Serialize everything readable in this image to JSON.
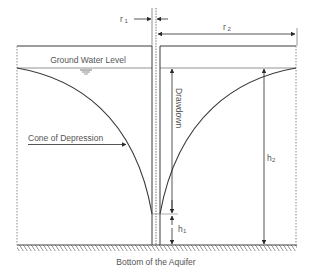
{
  "diagram": {
    "labels": {
      "r1": "r",
      "r1_sub": "1",
      "r2": "r",
      "r2_sub": "2",
      "ground_water_level": "Ground Water Level",
      "drawdown": "Drawdown",
      "cone_of_depression": "Cone of Depression",
      "h1": "h",
      "h1_sub": "1",
      "h2": "h",
      "h2_sub": "2",
      "bottom": "Bottom of the Aquifer"
    },
    "colors": {
      "line": "#3a3a3a",
      "text": "#555555",
      "dashed": "#777777"
    }
  }
}
